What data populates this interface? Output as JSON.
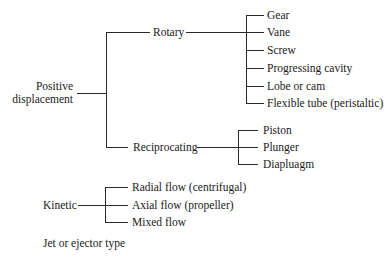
{
  "diagram": {
    "positive_displacement": {
      "label_line1": "Positive",
      "label_line2": "displacement",
      "rotary": {
        "label": "Rotary",
        "children": [
          "Gear",
          "Vane",
          "Screw",
          "Progressing cavity",
          "Lobe or cam",
          "Flexible tube (peristaltic)"
        ]
      },
      "reciprocating": {
        "label": "Reciprocating",
        "children": [
          "Piston",
          "Plunger",
          "Diapluagm"
        ]
      }
    },
    "kinetic": {
      "label": "Kinetic",
      "children": [
        "Radial flow (centrifugal)",
        "Axial flow (propeller)",
        "Mixed flow"
      ]
    },
    "jet": {
      "label": "Jet or ejector type"
    }
  },
  "colors": {
    "line": "#2a2a2a",
    "text": "#1a1a1a",
    "background": "#ffffff"
  }
}
